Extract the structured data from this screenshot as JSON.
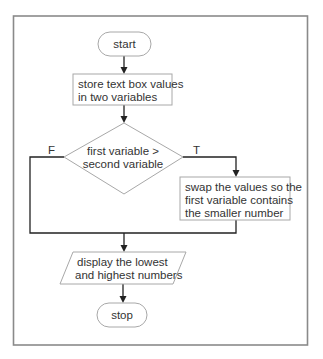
{
  "flowchart": {
    "start": {
      "label": "start"
    },
    "store": {
      "lines": [
        "store text box values",
        "in two variables"
      ]
    },
    "decision": {
      "lines": [
        "first variable >",
        "second variable"
      ],
      "false_label": "F",
      "true_label": "T"
    },
    "swap": {
      "lines": [
        "swap the values so the",
        "first variable contains",
        "the smaller number"
      ]
    },
    "display": {
      "lines": [
        "display the lowest",
        "and highest numbers"
      ]
    },
    "stop": {
      "label": "stop"
    }
  },
  "colors": {
    "frame": "#8a8a8a",
    "shape_outline": "#a8a8a8",
    "connector": "#222222",
    "text": "#333333"
  }
}
